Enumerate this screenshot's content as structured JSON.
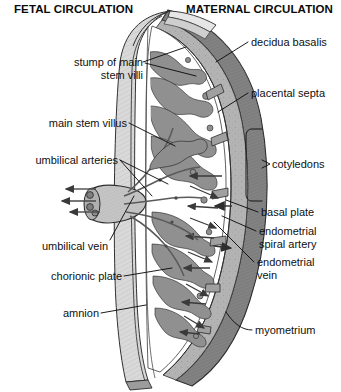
{
  "figure": {
    "headers": {
      "fetal": "FETAL CIRCULATION",
      "maternal": "MATERNAL CIRCULATION"
    },
    "colors": {
      "ink": "#101010",
      "myometrium": "#808080",
      "decidua": "#a8a8a8",
      "chorion": "#c9c9c9",
      "amnion": "#dedede",
      "villi": "#8d8d8d",
      "intervillous_space": "#ffffff",
      "background": "#ffffff"
    },
    "labels_left": [
      {
        "id": "stump-of-main-stem-villi",
        "line1": "stump of main",
        "line2": "stem villi"
      },
      {
        "id": "main-stem-villus",
        "line1": "main stem villus",
        "line2": ""
      },
      {
        "id": "umbilical-arteries",
        "line1": "umbilical arteries",
        "line2": ""
      },
      {
        "id": "umbilical-vein",
        "line1": "umbilical vein",
        "line2": ""
      },
      {
        "id": "chorionic-plate",
        "line1": "chorionic plate",
        "line2": ""
      },
      {
        "id": "amnion",
        "line1": "amnion",
        "line2": ""
      }
    ],
    "labels_right": [
      {
        "id": "decidua-basalis",
        "line1": "decidua basalis",
        "line2": ""
      },
      {
        "id": "placental-septa",
        "line1": "placental septa",
        "line2": ""
      },
      {
        "id": "cotyledons",
        "line1": "cotyledons",
        "line2": ""
      },
      {
        "id": "basal-plate",
        "line1": "basal plate",
        "line2": ""
      },
      {
        "id": "endometrial-spiral-artery",
        "line1": "endometrial",
        "line2": "spiral artery"
      },
      {
        "id": "endometrial-vein",
        "line1": "endometrial",
        "line2": "vein"
      },
      {
        "id": "myometrium",
        "line1": "myometrium",
        "line2": ""
      }
    ]
  }
}
